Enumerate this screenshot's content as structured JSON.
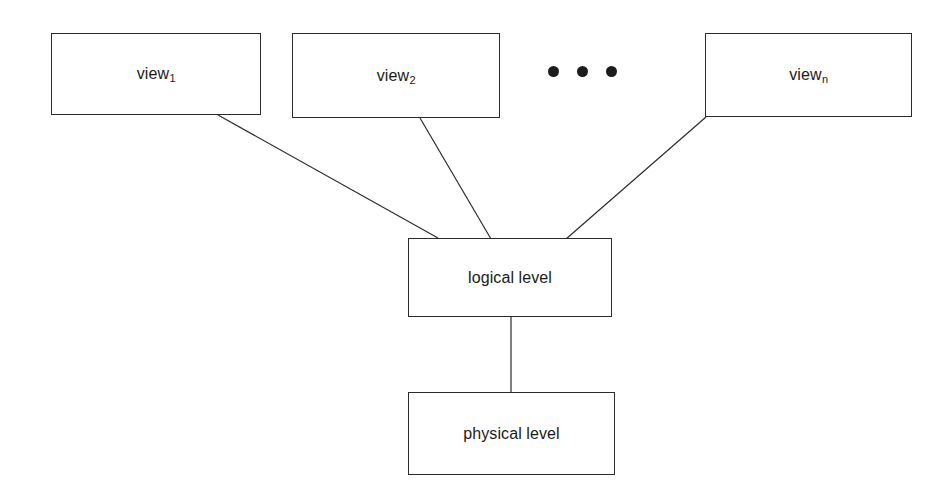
{
  "diagram": {
    "background_color": "#ffffff",
    "line_color": "#2b2b2b",
    "text_color": "#1a1a1a",
    "nodes": [
      {
        "id": "view1",
        "base_label": "view",
        "subscript": "1",
        "x": 51,
        "y": 33,
        "width": 210,
        "height": 82
      },
      {
        "id": "view2",
        "base_label": "view",
        "subscript": "2",
        "x": 292,
        "y": 33,
        "width": 208,
        "height": 85
      },
      {
        "id": "viewn",
        "base_label": "view",
        "subscript": "n",
        "x": 705,
        "y": 33,
        "width": 207,
        "height": 84
      },
      {
        "id": "logical",
        "base_label": "logical level",
        "subscript": "",
        "x": 408,
        "y": 238,
        "width": 204,
        "height": 79
      },
      {
        "id": "physical",
        "base_label": "physical level",
        "subscript": "",
        "x": 408,
        "y": 392,
        "width": 207,
        "height": 83
      }
    ],
    "ellipsis": {
      "label": "three-dots-continuation",
      "dot_count": 3,
      "x": 548,
      "y": 66
    },
    "edges": [
      {
        "id": "view1-to-logical",
        "from": "view1",
        "to": "logical",
        "x1": 218,
        "y1": 115,
        "x2": 438,
        "y2": 238
      },
      {
        "id": "view2-to-logical",
        "from": "view2",
        "to": "logical",
        "x1": 420,
        "y1": 118,
        "x2": 491,
        "y2": 239
      },
      {
        "id": "viewn-to-logical",
        "from": "viewn",
        "to": "logical",
        "x1": 706,
        "y1": 117,
        "x2": 566,
        "y2": 239
      },
      {
        "id": "logical-to-physical",
        "from": "logical",
        "to": "physical",
        "x1": 511,
        "y1": 317,
        "x2": 511,
        "y2": 392
      }
    ]
  }
}
